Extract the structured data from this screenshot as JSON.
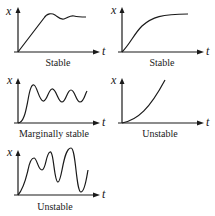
{
  "figure": {
    "panels": [
      {
        "id": "stable-overshoot",
        "caption": "Stable",
        "y_label": "x",
        "x_label": "t",
        "behavior": "rise with overshoot, damped oscillation settling to constant"
      },
      {
        "id": "stable-smooth",
        "caption": "Stable",
        "y_label": "x",
        "x_label": "t",
        "behavior": "smooth monotonic rise approaching constant"
      },
      {
        "id": "marginally-stable",
        "caption": "Marginally stable",
        "y_label": "x",
        "x_label": "t",
        "behavior": "sustained oscillation of constant amplitude"
      },
      {
        "id": "unstable-growth",
        "caption": "Unstable",
        "y_label": "x",
        "x_label": "t",
        "behavior": "monotonic unbounded growth"
      },
      {
        "id": "unstable-oscillation",
        "caption": "Unstable",
        "y_label": "x",
        "x_label": "t",
        "behavior": "oscillation with growing amplitude"
      }
    ]
  }
}
